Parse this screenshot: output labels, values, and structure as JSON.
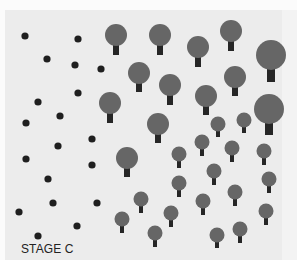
{
  "figure": {
    "label": "STAGE C",
    "colors": {
      "background": "#fbfbfb",
      "panel": "#ececec",
      "seed_dot": "#1f1f1f",
      "tree_canopy": "#666666",
      "tree_trunk": "#262626",
      "label_text": "#222222"
    }
  },
  "seeds": [
    {
      "x": 25,
      "y": 36
    },
    {
      "x": 78,
      "y": 39
    },
    {
      "x": 47,
      "y": 59
    },
    {
      "x": 75,
      "y": 65
    },
    {
      "x": 101,
      "y": 69
    },
    {
      "x": 78,
      "y": 93
    },
    {
      "x": 38,
      "y": 102
    },
    {
      "x": 60,
      "y": 116
    },
    {
      "x": 26,
      "y": 123
    },
    {
      "x": 92,
      "y": 139
    },
    {
      "x": 58,
      "y": 146
    },
    {
      "x": 26,
      "y": 159
    },
    {
      "x": 92,
      "y": 165
    },
    {
      "x": 48,
      "y": 179
    },
    {
      "x": 53,
      "y": 203
    },
    {
      "x": 97,
      "y": 203
    },
    {
      "x": 19,
      "y": 212
    },
    {
      "x": 77,
      "y": 226
    },
    {
      "x": 38,
      "y": 236
    }
  ],
  "trees": [
    {
      "size": "large",
      "x": 116,
      "y": 35,
      "r": 11,
      "trunk_top": 45,
      "trunk_bottom": 55,
      "trunk_w": 6
    },
    {
      "size": "large",
      "x": 160,
      "y": 35,
      "r": 11,
      "trunk_top": 45,
      "trunk_bottom": 55,
      "trunk_w": 6
    },
    {
      "size": "large",
      "x": 198,
      "y": 47,
      "r": 11,
      "trunk_top": 57,
      "trunk_bottom": 67,
      "trunk_w": 6
    },
    {
      "size": "large",
      "x": 231,
      "y": 31,
      "r": 11,
      "trunk_top": 41,
      "trunk_bottom": 51,
      "trunk_w": 6
    },
    {
      "size": "xlarge",
      "x": 271,
      "y": 55,
      "r": 15,
      "trunk_top": 69,
      "trunk_bottom": 82,
      "trunk_w": 8
    },
    {
      "size": "large",
      "x": 139,
      "y": 73,
      "r": 11,
      "trunk_top": 83,
      "trunk_bottom": 92,
      "trunk_w": 6
    },
    {
      "size": "large",
      "x": 170,
      "y": 85,
      "r": 11,
      "trunk_top": 95,
      "trunk_bottom": 105,
      "trunk_w": 6
    },
    {
      "size": "large",
      "x": 235,
      "y": 77,
      "r": 11,
      "trunk_top": 87,
      "trunk_bottom": 96,
      "trunk_w": 6
    },
    {
      "size": "large",
      "x": 110,
      "y": 103,
      "r": 11,
      "trunk_top": 113,
      "trunk_bottom": 123,
      "trunk_w": 6
    },
    {
      "size": "large",
      "x": 206,
      "y": 96,
      "r": 11,
      "trunk_top": 106,
      "trunk_bottom": 115,
      "trunk_w": 6
    },
    {
      "size": "xlarge",
      "x": 269,
      "y": 109,
      "r": 15,
      "trunk_top": 123,
      "trunk_bottom": 135,
      "trunk_w": 8
    },
    {
      "size": "large",
      "x": 158,
      "y": 124,
      "r": 11,
      "trunk_top": 134,
      "trunk_bottom": 143,
      "trunk_w": 6
    },
    {
      "size": "large",
      "x": 127,
      "y": 158,
      "r": 11,
      "trunk_top": 168,
      "trunk_bottom": 177,
      "trunk_w": 6
    },
    {
      "size": "small",
      "x": 218,
      "y": 124,
      "r": 7.5,
      "trunk_top": 131,
      "trunk_bottom": 137,
      "trunk_w": 4
    },
    {
      "size": "small",
      "x": 244,
      "y": 120,
      "r": 7.5,
      "trunk_top": 127,
      "trunk_bottom": 133,
      "trunk_w": 4
    },
    {
      "size": "small",
      "x": 202,
      "y": 142,
      "r": 7.5,
      "trunk_top": 149,
      "trunk_bottom": 156,
      "trunk_w": 4
    },
    {
      "size": "small",
      "x": 232,
      "y": 148,
      "r": 7.5,
      "trunk_top": 155,
      "trunk_bottom": 162,
      "trunk_w": 4
    },
    {
      "size": "small",
      "x": 264,
      "y": 151,
      "r": 7.5,
      "trunk_top": 158,
      "trunk_bottom": 165,
      "trunk_w": 4
    },
    {
      "size": "small",
      "x": 179,
      "y": 154,
      "r": 7.5,
      "trunk_top": 161,
      "trunk_bottom": 168,
      "trunk_w": 4
    },
    {
      "size": "small",
      "x": 214,
      "y": 171,
      "r": 7.5,
      "trunk_top": 178,
      "trunk_bottom": 185,
      "trunk_w": 4
    },
    {
      "size": "small",
      "x": 269,
      "y": 179,
      "r": 7.5,
      "trunk_top": 186,
      "trunk_bottom": 193,
      "trunk_w": 4
    },
    {
      "size": "small",
      "x": 179,
      "y": 183,
      "r": 7.5,
      "trunk_top": 190,
      "trunk_bottom": 197,
      "trunk_w": 4
    },
    {
      "size": "small",
      "x": 235,
      "y": 192,
      "r": 7.5,
      "trunk_top": 199,
      "trunk_bottom": 206,
      "trunk_w": 4
    },
    {
      "size": "small",
      "x": 141,
      "y": 199,
      "r": 7.5,
      "trunk_top": 206,
      "trunk_bottom": 213,
      "trunk_w": 4
    },
    {
      "size": "small",
      "x": 203,
      "y": 201,
      "r": 7.5,
      "trunk_top": 208,
      "trunk_bottom": 215,
      "trunk_w": 4
    },
    {
      "size": "small",
      "x": 266,
      "y": 211,
      "r": 7.5,
      "trunk_top": 218,
      "trunk_bottom": 225,
      "trunk_w": 4
    },
    {
      "size": "small",
      "x": 171,
      "y": 213,
      "r": 7.5,
      "trunk_top": 220,
      "trunk_bottom": 227,
      "trunk_w": 4
    },
    {
      "size": "small",
      "x": 122,
      "y": 219,
      "r": 7.5,
      "trunk_top": 226,
      "trunk_bottom": 233,
      "trunk_w": 4
    },
    {
      "size": "small",
      "x": 240,
      "y": 229,
      "r": 7.5,
      "trunk_top": 236,
      "trunk_bottom": 243,
      "trunk_w": 4
    },
    {
      "size": "small",
      "x": 155,
      "y": 233,
      "r": 7.5,
      "trunk_top": 240,
      "trunk_bottom": 247,
      "trunk_w": 4
    },
    {
      "size": "small",
      "x": 217,
      "y": 235,
      "r": 7.5,
      "trunk_top": 242,
      "trunk_bottom": 248,
      "trunk_w": 4
    }
  ]
}
